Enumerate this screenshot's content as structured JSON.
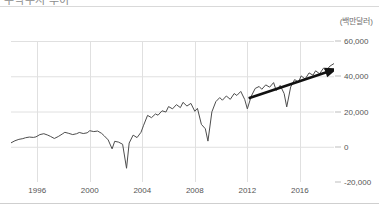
{
  "header": {
    "title": "무역수지 추이",
    "title_clipped": true
  },
  "chart_data": {
    "type": "line",
    "title": "무역수지 추이",
    "unit_label": "(백만달러)",
    "xlabel": "",
    "ylabel": "",
    "grid": true,
    "legend": "none",
    "xlim": [
      1994.0,
      2018.6
    ],
    "ylim": [
      -20000,
      60000
    ],
    "xticks": [
      1996,
      2000,
      2004,
      2008,
      2012,
      2016
    ],
    "xticklabels": [
      "1996",
      "2000",
      "2004",
      "2008",
      "2012",
      "2016"
    ],
    "yticks": [
      -20000,
      0,
      20000,
      40000,
      60000
    ],
    "yticklabels": [
      "-20,000",
      "0",
      "20,000",
      "40,000",
      "60,000"
    ],
    "line_color": "#4d4d4d",
    "annotation": {
      "type": "arrow",
      "label": "상승 추세 화살표",
      "color": "#111111",
      "x_start": 2012.1,
      "y_start": 27500,
      "x_end": 2018.9,
      "y_end": 44500
    },
    "series": [
      {
        "name": "무역수지",
        "x": [
          1994.0,
          1994.3,
          1994.6,
          1994.9,
          1995.1,
          1995.4,
          1995.7,
          1995.9,
          1996.2,
          1996.5,
          1996.8,
          1997.0,
          1997.3,
          1997.6,
          1997.9,
          1998.1,
          1998.4,
          1998.7,
          1999.0,
          1999.2,
          1999.5,
          1999.8,
          2000.0,
          2000.3,
          2000.6,
          2000.9,
          2001.1,
          2001.4,
          2001.7,
          2001.9,
          2002.2,
          2002.5,
          2002.8,
          2003.0,
          2003.3,
          2003.6,
          2003.9,
          2004.1,
          2004.4,
          2004.7,
          2005.0,
          2005.2,
          2005.5,
          2005.8,
          2006.0,
          2006.3,
          2006.6,
          2006.9,
          2007.1,
          2007.4,
          2007.7,
          2008.0,
          2008.2,
          2008.5,
          2008.8,
          2009.0,
          2009.3,
          2009.6,
          2009.9,
          2010.1,
          2010.4,
          2010.7,
          2011.0,
          2011.2,
          2011.5,
          2011.8,
          2012.0,
          2012.3,
          2012.6,
          2012.9,
          2013.1,
          2013.4,
          2013.7,
          2014.0,
          2014.2,
          2014.5,
          2014.8,
          2015.0,
          2015.3,
          2015.6,
          2015.9,
          2016.1,
          2016.4,
          2016.7,
          2017.0,
          2017.2,
          2017.5,
          2017.8,
          2018.0,
          2018.3,
          2018.6
        ],
        "y": [
          2200,
          3400,
          4200,
          4600,
          5100,
          5500,
          5300,
          5600,
          6900,
          7400,
          6600,
          5900,
          4700,
          5800,
          7200,
          8200,
          7600,
          6900,
          7400,
          8100,
          7500,
          7900,
          9100,
          8600,
          8900,
          7600,
          6200,
          3900,
          -1200,
          3100,
          2600,
          1400,
          -12200,
          2100,
          6600,
          5200,
          8200,
          12200,
          17800,
          16500,
          18600,
          17900,
          20400,
          19700,
          22800,
          21500,
          23900,
          22200,
          25200,
          23100,
          24600,
          20100,
          21800,
          12700,
          10200,
          3200,
          19800,
          25600,
          27900,
          26400,
          28800,
          26900,
          30200,
          29100,
          31400,
          26800,
          21500,
          28700,
          33100,
          34200,
          32600,
          35100,
          33800,
          36400,
          31900,
          34800,
          30200,
          22600,
          33900,
          38100,
          36700,
          40200,
          38400,
          41900,
          40600,
          43100,
          41400,
          44600,
          43200,
          45800,
          47200
        ]
      }
    ]
  },
  "axis": {
    "y_labels": [
      {
        "value": 60000,
        "text": "60,000"
      },
      {
        "value": 40000,
        "text": "40,000"
      },
      {
        "value": 20000,
        "text": "20,000"
      },
      {
        "value": 0,
        "text": "0"
      },
      {
        "value": -20000,
        "text": "-20,000"
      }
    ],
    "x_labels": [
      {
        "value": 1996,
        "text": "1996"
      },
      {
        "value": 2000,
        "text": "2000"
      },
      {
        "value": 2004,
        "text": "2004"
      },
      {
        "value": 2008,
        "text": "2008"
      },
      {
        "value": 2012,
        "text": "2012"
      },
      {
        "value": 2016,
        "text": "2016"
      }
    ]
  }
}
